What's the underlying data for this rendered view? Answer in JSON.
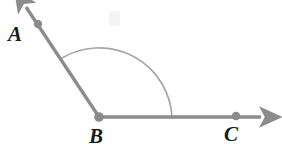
{
  "figure": {
    "kind": "geometry-angle-diagram",
    "background_color": "#ffffff",
    "ray_color": "#8c8c8c",
    "arc_color": "#a6a6a6",
    "point_color": "#8c8c8c",
    "label_color": "#1a1a1a",
    "labels": [
      {
        "id": "A",
        "text": "A",
        "x": 8,
        "y": 24
      },
      {
        "id": "B",
        "text": "B",
        "x": 89,
        "y": 126
      },
      {
        "id": "C",
        "text": "C",
        "x": 224,
        "y": 124
      }
    ],
    "points": [
      {
        "id": "A",
        "x": 38,
        "y": 24,
        "radius": 4.2
      },
      {
        "id": "B",
        "x": 99,
        "y": 117,
        "radius": 4.6
      },
      {
        "id": "C",
        "x": 236,
        "y": 116,
        "radius": 4.2
      }
    ],
    "rays": [
      {
        "id": "ray-BA",
        "from": "B",
        "through": "A",
        "x1": 99,
        "y1": 117,
        "x2": 26,
        "y2": 7,
        "arrow_tip": {
          "x": 22,
          "y": 2
        },
        "stroke_width": 3.4
      },
      {
        "id": "ray-BC",
        "from": "B",
        "through": "C",
        "x1": 99,
        "y1": 117,
        "x2": 262,
        "y2": 117,
        "arrow_tip": {
          "x": 274,
          "y": 117
        },
        "stroke_width": 3.4
      }
    ],
    "arc": {
      "id": "angle-arc-ABC",
      "center": {
        "x": 99,
        "y": 117
      },
      "radius": 73,
      "start": {
        "x": 62,
        "y": 58
      },
      "end": {
        "x": 172,
        "y": 117
      },
      "apex": {
        "x": 107,
        "y": 44
      },
      "stroke_width": 1.7
    },
    "smudge": {
      "x": 110,
      "y": 18,
      "width": 10,
      "height": 14,
      "color": "#f2f2f4"
    }
  }
}
